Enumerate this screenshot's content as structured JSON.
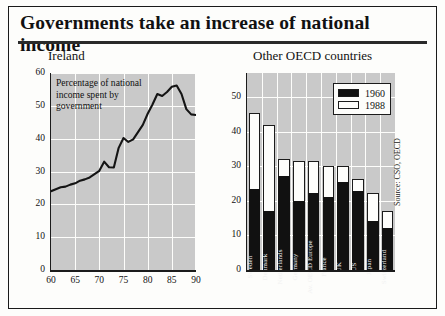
{
  "figure": {
    "title": "Governments take an increase of national income",
    "source_note": "Source: CSO, OECD"
  },
  "chart_data": [
    {
      "type": "line",
      "title": "Ireland",
      "annotation": "Percentage of national income spent by government",
      "xlabel": "",
      "ylabel": "",
      "xlim": [
        60,
        90
      ],
      "ylim": [
        0,
        60
      ],
      "xticks": [
        60,
        65,
        70,
        75,
        80,
        85,
        90
      ],
      "yticks": [
        0,
        10,
        20,
        30,
        40,
        50,
        60
      ],
      "grid": true,
      "legend": "none",
      "x": [
        60,
        61,
        62,
        63,
        64,
        65,
        66,
        67,
        68,
        69,
        70,
        71,
        72,
        73,
        74,
        75,
        76,
        77,
        78,
        79,
        80,
        81,
        82,
        83,
        84,
        85,
        86,
        87,
        88,
        89,
        90
      ],
      "values": [
        24.0,
        24.6,
        25.2,
        25.4,
        26.0,
        26.4,
        27.2,
        27.6,
        28.2,
        29.2,
        30.2,
        33.0,
        31.3,
        31.2,
        37.2,
        40.2,
        39.0,
        39.8,
        42.0,
        44.2,
        47.6,
        50.4,
        53.6,
        53.0,
        54.2,
        55.8,
        56.2,
        53.6,
        49.0,
        47.4,
        47.2
      ]
    },
    {
      "type": "bar",
      "subtype": "stacked-overlay",
      "title": "Other OECD countries",
      "xlabel": "",
      "ylabel": "",
      "ylim": [
        0,
        57
      ],
      "yticks": [
        0,
        10,
        20,
        30,
        40,
        50
      ],
      "grid": true,
      "legend_position": "top-right",
      "categories": [
        "Sweden",
        "Denmark",
        "Netherlands",
        "Germany",
        "Av. OECD Europe",
        "France",
        "UK",
        "US",
        "Japan",
        "Switzerland"
      ],
      "series": [
        {
          "name": "1960",
          "values": [
            23.5,
            17.2,
            27.2,
            20.1,
            22.2,
            21.2,
            25.6,
            23.0,
            14.3,
            12.2
          ]
        },
        {
          "name": "1988",
          "values": [
            45.5,
            42.0,
            32.0,
            31.6,
            31.5,
            30.2,
            30.2,
            26.2,
            22.2,
            17.2
          ]
        }
      ]
    }
  ]
}
